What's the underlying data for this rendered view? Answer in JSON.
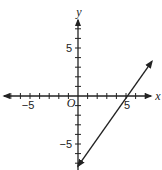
{
  "chart_data": {
    "type": "line",
    "title": "",
    "xlabel": "x",
    "ylabel": "y",
    "origin_label": "O",
    "xlim": [
      -8,
      7.7
    ],
    "ylim": [
      -7.7,
      7.7
    ],
    "grid": false,
    "x_ticks": [
      -7,
      -6,
      -5,
      -4,
      -3,
      -2,
      -1,
      1,
      2,
      3,
      4,
      5,
      6,
      7
    ],
    "y_ticks": [
      -7,
      -6,
      -5,
      -4,
      -3,
      -2,
      -1,
      1,
      2,
      3,
      4,
      5,
      6,
      7
    ],
    "x_tick_labels": [
      {
        "value": -5,
        "text": "−5"
      },
      {
        "value": 5,
        "text": "5"
      }
    ],
    "y_tick_labels": [
      {
        "value": 5,
        "text": "5"
      },
      {
        "value": -5,
        "text": "−5"
      }
    ],
    "series": [
      {
        "name": "line",
        "equation": "y = 1.4x - 7",
        "x": [
          0,
          7.7
        ],
        "y": [
          -7.3,
          3.6
        ],
        "arrows": "both"
      }
    ]
  }
}
